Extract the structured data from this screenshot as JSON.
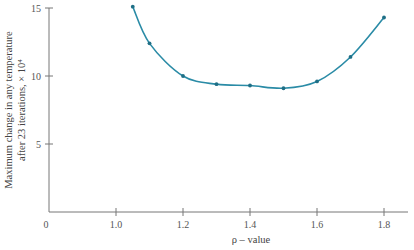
{
  "chart_data": {
    "type": "line",
    "title": "",
    "xlabel": "ρ – value",
    "ylabel": [
      "Maximum change in any temperature",
      "after 23 iterations, × 10⁴"
    ],
    "xlim": [
      0.85,
      1.85
    ],
    "ylim": [
      0,
      15
    ],
    "x_ticks": [
      "1.0",
      "1.2",
      "1.4",
      "1.6",
      "1.8"
    ],
    "y_ticks": [
      "5",
      "10",
      "15"
    ],
    "origin_label": "0",
    "grid": false,
    "legend": null,
    "series": [
      {
        "name": "max change",
        "color": "#2a8ba6",
        "x": [
          1.05,
          1.1,
          1.2,
          1.3,
          1.4,
          1.5,
          1.6,
          1.7,
          1.8
        ],
        "y": [
          15.1,
          12.4,
          10.0,
          9.4,
          9.3,
          9.1,
          9.6,
          11.4,
          14.3
        ]
      }
    ]
  }
}
